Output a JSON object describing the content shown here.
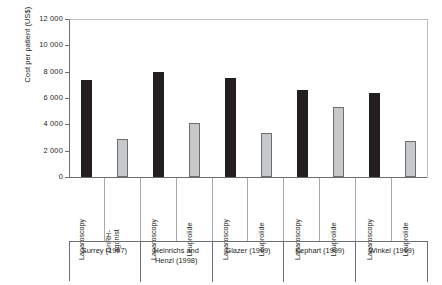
{
  "chart_data": {
    "type": "bar",
    "title": "",
    "xlabel": "",
    "ylabel": "Cost per patient (US$)",
    "ylim": [
      0,
      12000
    ],
    "ytick_labels": [
      "12 000",
      "10 000",
      "8 000",
      "6 000",
      "4 000",
      "2 000",
      "0"
    ],
    "ytick_values": [
      12000,
      10000,
      8000,
      6000,
      4000,
      2000,
      0
    ],
    "grid": false,
    "legend": "none",
    "categories": [
      "Laparoscopy",
      "GnRH-\nagonist",
      "Laparoscopy",
      "Leuprolide",
      "Laparoscopy",
      "Leuprolide",
      "Laparoscopy",
      "Leuprolide",
      "Laparoscopy",
      "Leuprolide"
    ],
    "values": [
      7400,
      2900,
      8000,
      4100,
      7500,
      3350,
      6600,
      5300,
      6400,
      2700
    ],
    "bar_colors": [
      "#231f20",
      "#c6c7c9",
      "#231f20",
      "#c6c7c9",
      "#231f20",
      "#c6c7c9",
      "#231f20",
      "#c6c7c9",
      "#231f20",
      "#c6c7c9"
    ],
    "groups": [
      {
        "label": "Surrey (1997)",
        "categories": [
          "Laparoscopy",
          "GnRH-\nagonist"
        ],
        "values": [
          7400,
          2900
        ]
      },
      {
        "label": "Heinrichs and\nHenzl (1998)",
        "categories": [
          "Laparoscopy",
          "Leuprolide"
        ],
        "values": [
          8000,
          4100
        ]
      },
      {
        "label": "Glazer (1999)",
        "categories": [
          "Laparoscopy",
          "Leuprolide"
        ],
        "values": [
          7500,
          3350
        ]
      },
      {
        "label": "Kephart (1999)",
        "categories": [
          "Laparoscopy",
          "Leuprolide"
        ],
        "values": [
          6600,
          5300
        ]
      },
      {
        "label": "Winkel (1999)",
        "categories": [
          "Laparoscopy",
          "Leuprolide"
        ],
        "values": [
          6400,
          2700
        ]
      }
    ]
  },
  "colors": {
    "surgical_bar": "#231f20",
    "medical_bar": "#c6c7c9",
    "axis": "#6d6e71",
    "frame_light": "#bcbec0",
    "text": "#231f20",
    "background": "#ffffff"
  }
}
